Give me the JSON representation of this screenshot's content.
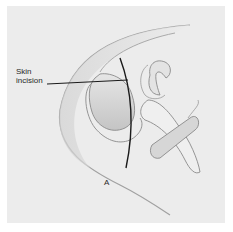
{
  "figure": {
    "callout_label_line1": "Skin",
    "callout_label_line2": "incision",
    "panel_letter": "A"
  },
  "colors": {
    "background": "#ffffff",
    "panel": "#ececec",
    "outline": "#9a9a9a",
    "incision_line": "#1a1a1a",
    "shade": "#c8c8c8"
  }
}
